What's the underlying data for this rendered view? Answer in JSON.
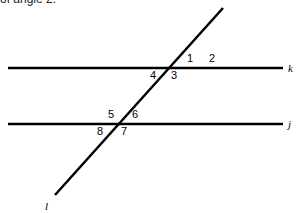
{
  "caption": "of angle 2.",
  "lines": {
    "k": {
      "label": "k",
      "x1": 8,
      "y1": 68,
      "x2": 283,
      "y2": 68
    },
    "j": {
      "label": "j",
      "x1": 8,
      "y1": 124,
      "x2": 283,
      "y2": 124
    },
    "l": {
      "label": "l",
      "x1": 223,
      "y1": 8,
      "x2": 55,
      "y2": 195
    }
  },
  "angles": [
    {
      "id": "1",
      "x": 187,
      "y": 62
    },
    {
      "id": "2",
      "x": 209,
      "y": 62
    },
    {
      "id": "3",
      "x": 171,
      "y": 79
    },
    {
      "id": "4",
      "x": 150,
      "y": 79
    },
    {
      "id": "5",
      "x": 108,
      "y": 118
    },
    {
      "id": "6",
      "x": 132,
      "y": 118
    },
    {
      "id": "7",
      "x": 121,
      "y": 135
    },
    {
      "id": "8",
      "x": 97,
      "y": 135
    }
  ],
  "colors": {
    "line": "#000000",
    "background": "#ffffff"
  }
}
